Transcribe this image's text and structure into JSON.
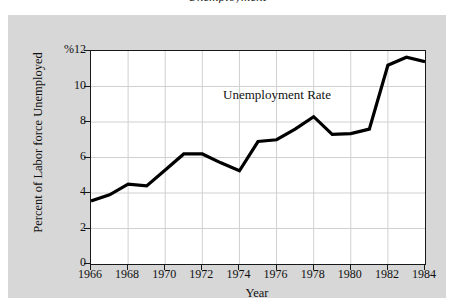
{
  "figure": {
    "clipped_caption": "Unemployment",
    "background_color": "#d7d7d7",
    "plot_background_color": "#ffffff",
    "axis_color": "#16181a",
    "grid_color": "#d0d0d0",
    "line_color": "#000000"
  },
  "chart_data": {
    "type": "line",
    "title": "",
    "xlabel": "Year",
    "ylabel": "Percent of Labor force Unemployed",
    "y_unit_label": "%12",
    "xlim": [
      1966,
      1984
    ],
    "ylim": [
      0,
      12
    ],
    "grid": true,
    "legend_position": "none",
    "annotations": [
      {
        "text": "Unemployment Rate",
        "x": 1973.6,
        "y": 9.4
      }
    ],
    "xticks": [
      1966,
      1968,
      1970,
      1972,
      1974,
      1976,
      1978,
      1980,
      1982,
      1984
    ],
    "xtick_labels": [
      "1966",
      "1968",
      "1970",
      "1972",
      "1974",
      "1976",
      "1978",
      "1980",
      "1982",
      "1984"
    ],
    "yticks": [
      0,
      2,
      4,
      6,
      8,
      10,
      12
    ],
    "ytick_labels": [
      "0",
      "2",
      "4",
      "6",
      "8",
      "10",
      "%12"
    ],
    "series": [
      {
        "name": "Unemployment Rate",
        "x": [
          1966,
          1967,
          1968,
          1969,
          1970,
          1971,
          1972,
          1973,
          1974,
          1975,
          1976,
          1977,
          1978,
          1979,
          1980,
          1981,
          1982,
          1983,
          1984
        ],
        "values": [
          3.55,
          3.9,
          4.5,
          4.4,
          5.3,
          6.2,
          6.2,
          5.7,
          5.25,
          6.9,
          7.0,
          7.6,
          8.3,
          7.3,
          7.35,
          7.6,
          11.2,
          11.65,
          11.4
        ]
      }
    ]
  }
}
